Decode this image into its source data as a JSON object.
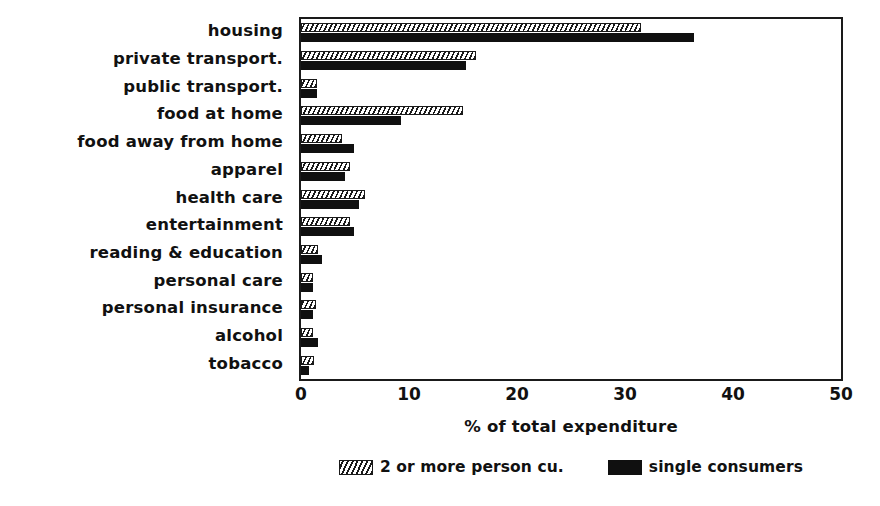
{
  "chart_data": {
    "type": "bar",
    "orientation": "horizontal",
    "title": "",
    "xlabel": "% of total expenditure",
    "ylabel": "",
    "xlim": [
      0,
      50
    ],
    "xticks": [
      0,
      10,
      20,
      30,
      40,
      50
    ],
    "xticklabels": [
      "0",
      "10",
      "20",
      "30",
      "40",
      "50"
    ],
    "grid": false,
    "legend_position": "below-axis-center",
    "categories": [
      "housing",
      "private transport.",
      "public transport.",
      "food at home",
      "food away from home",
      "apparel",
      "health care",
      "entertainment",
      "reading & education",
      "personal care",
      "personal insurance",
      "alcohol",
      "tobacco"
    ],
    "series": [
      {
        "name": "2 or more person cu.",
        "fill": "hatched",
        "color": "#1a1a1a",
        "values": [
          31.5,
          16.2,
          1.5,
          15.0,
          3.8,
          4.5,
          5.9,
          4.5,
          1.6,
          1.1,
          1.4,
          1.1,
          1.2
        ]
      },
      {
        "name": "single consumers",
        "fill": "solid",
        "color": "#101010",
        "values": [
          36.4,
          15.3,
          1.5,
          9.3,
          4.9,
          4.1,
          5.4,
          4.9,
          1.9,
          1.1,
          1.1,
          1.6,
          0.7
        ]
      }
    ]
  },
  "legend": {
    "entries": [
      {
        "label": "2 or more person cu.",
        "swatch": "hatched-swatch"
      },
      {
        "label": "single consumers",
        "swatch": "solid-swatch"
      }
    ]
  }
}
